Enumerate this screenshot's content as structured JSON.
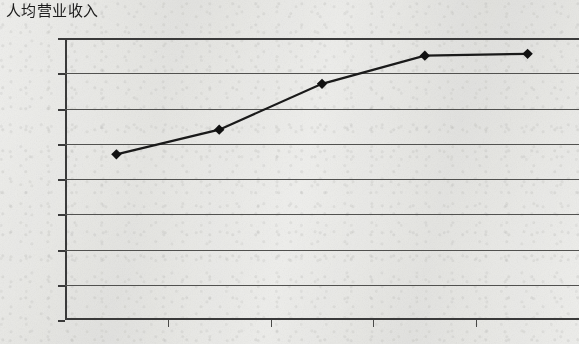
{
  "chart_data": {
    "type": "line",
    "title": "人均营业收入",
    "xlabel": "",
    "ylabel": "",
    "categories": [
      "2008",
      "2009",
      "2010",
      "2011",
      "2012"
    ],
    "values": [
      47,
      54,
      67,
      75,
      75.5
    ],
    "series": [
      {
        "name": "人均营业收入",
        "values": [
          47,
          54,
          67,
          75,
          75.5
        ]
      }
    ],
    "ylim": [
      0,
      80
    ],
    "ytick_labels": [
      "0",
      "10",
      "20",
      "30",
      "40",
      "50",
      "60",
      "70",
      "80"
    ],
    "ytick_values": [
      0,
      10,
      20,
      30,
      40,
      50,
      60,
      70,
      80
    ],
    "grid": "horizontal",
    "legend": "none",
    "marker": "diamond",
    "line_color": "#1a1a1a",
    "marker_color": "#111111",
    "grid_color": "#51514f",
    "axis_color": "#3a3a3a",
    "background_color": "#f2f2f0"
  },
  "chart": {
    "title": "人均营业收入"
  }
}
